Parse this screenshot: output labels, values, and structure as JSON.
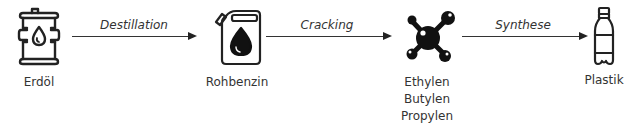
{
  "diagram": {
    "type": "process-flow",
    "nodes": [
      {
        "id": "erdoel",
        "label": "Erdöl",
        "icon": "oil-barrel-icon"
      },
      {
        "id": "rohbenzin",
        "label": "Rohbenzin",
        "icon": "jerrycan-icon"
      },
      {
        "id": "olefine",
        "labels": [
          "Ethylen",
          "Butylen",
          "Propylen"
        ],
        "icon": "molecule-icon"
      },
      {
        "id": "plastik",
        "label": "Plastik",
        "icon": "plastic-bottle-icon"
      }
    ],
    "edges": [
      {
        "from": "erdoel",
        "to": "rohbenzin",
        "label": "Destillation"
      },
      {
        "from": "rohbenzin",
        "to": "olefine",
        "label": "Cracking"
      },
      {
        "from": "olefine",
        "to": "plastik",
        "label": "Synthese"
      }
    ],
    "colors": {
      "stroke": "#222222",
      "background": "#ffffff"
    }
  }
}
